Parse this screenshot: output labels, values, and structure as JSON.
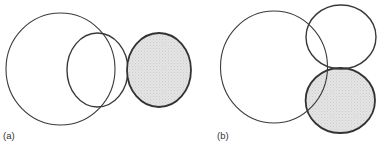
{
  "panels": [
    {
      "label": "(a)",
      "shapes": [
        {
          "name": "large-circle",
          "cx": 60.5,
          "cy": 69,
          "rx": 54.5,
          "ry": 56,
          "fill": "none",
          "stroke_width": 1.1
        },
        {
          "name": "medium-circle",
          "cx": 97.5,
          "cy": 70,
          "rx": 30.5,
          "ry": 37,
          "fill": "none",
          "stroke_width": 1.4
        },
        {
          "name": "shaded-circle",
          "cx": 159,
          "cy": 70,
          "rx": 32,
          "ry": 37,
          "fill": "shaded",
          "stroke_width": 1.8
        }
      ]
    },
    {
      "label": "(b)",
      "shapes": [
        {
          "name": "large-circle",
          "cx": 274,
          "cy": 67,
          "rx": 53.5,
          "ry": 56,
          "fill": "none",
          "stroke_width": 1.1
        },
        {
          "name": "upper-circle",
          "cx": 341,
          "cy": 37,
          "rx": 35,
          "ry": 32,
          "fill": "none",
          "stroke_width": 1.4
        },
        {
          "name": "shaded-circle",
          "cx": 340.3,
          "cy": 100.5,
          "rx": 34.7,
          "ry": 32.5,
          "fill": "shaded",
          "stroke_width": 1.8
        }
      ]
    }
  ],
  "colors": {
    "stroke": "#3a3a3a",
    "shade": "#e2e2e2",
    "shade_dot": "#cfcfcf",
    "label": "#333333"
  }
}
